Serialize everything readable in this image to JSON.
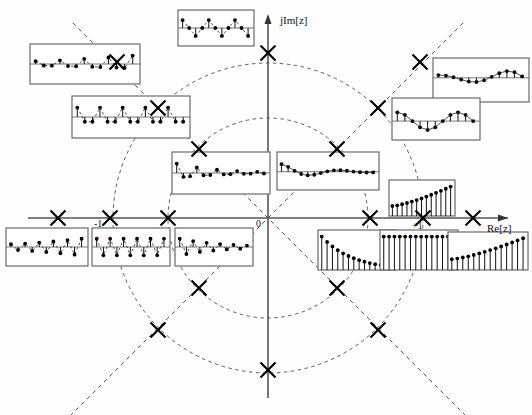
{
  "figure": {
    "domain": "z-plane",
    "axes": {
      "real_label": "Re[z]",
      "imag_label": "jIm[z]",
      "origin_label": "0",
      "tick_minus_one": "-1",
      "tick_plus_one": "+1"
    },
    "origin_px": {
      "x": 268,
      "y": 218
    },
    "circles": [
      {
        "name": "inner-dashed-circle",
        "radius_px": 100,
        "radius_value": 0.65
      },
      {
        "name": "unit-circle-dashed",
        "radius_px": 155,
        "radius_value": 1.0
      }
    ],
    "radial_lines": [
      {
        "name": "real-axis",
        "angle_deg": 0
      },
      {
        "name": "imaginary-axis",
        "angle_deg": 90
      },
      {
        "name": "diagonal-45",
        "angle_deg": 45
      },
      {
        "name": "diagonal-135",
        "angle_deg": 135
      }
    ],
    "pole_marker": "x-cross",
    "poles": [
      {
        "id": "p-re-neg-3",
        "x": 58,
        "y": 218,
        "angle_deg": 180,
        "radius_px": 210
      },
      {
        "id": "p-re-neg-2",
        "x": 110,
        "y": 218,
        "angle_deg": 180,
        "radius_px": 158
      },
      {
        "id": "p-re-neg-1",
        "x": 168,
        "y": 218,
        "angle_deg": 180,
        "radius_px": 100
      },
      {
        "id": "p-re-pos-1",
        "x": 370,
        "y": 218,
        "angle_deg": 0,
        "radius_px": 102
      },
      {
        "id": "p-re-pos-2",
        "x": 423,
        "y": 218,
        "angle_deg": 0,
        "radius_px": 155
      },
      {
        "id": "p-re-pos-3",
        "x": 473,
        "y": 218,
        "angle_deg": 0,
        "radius_px": 205
      },
      {
        "id": "p-im-pos",
        "x": 268,
        "y": 53,
        "angle_deg": 90,
        "radius_px": 165
      },
      {
        "id": "p-im-neg",
        "x": 268,
        "y": 370,
        "angle_deg": 270,
        "radius_px": 152
      },
      {
        "id": "p-ul-1",
        "x": 199,
        "y": 149,
        "angle_deg": 135,
        "radius_px": 98
      },
      {
        "id": "p-ul-2",
        "x": 158,
        "y": 108,
        "angle_deg": 135,
        "radius_px": 156
      },
      {
        "id": "p-ul-3",
        "x": 117,
        "y": 62,
        "angle_deg": 135,
        "radius_px": 215
      },
      {
        "id": "p-ur-1",
        "x": 337,
        "y": 149,
        "angle_deg": 45,
        "radius_px": 98
      },
      {
        "id": "p-ur-2",
        "x": 378,
        "y": 108,
        "angle_deg": 45,
        "radius_px": 156
      },
      {
        "id": "p-ur-3",
        "x": 420,
        "y": 62,
        "angle_deg": 45,
        "radius_px": 215
      },
      {
        "id": "p-ll-1",
        "x": 199,
        "y": 288,
        "angle_deg": 225,
        "radius_px": 98
      },
      {
        "id": "p-ll-2",
        "x": 158,
        "y": 330,
        "angle_deg": 225,
        "radius_px": 156
      },
      {
        "id": "p-lr-1",
        "x": 337,
        "y": 288,
        "angle_deg": 315,
        "radius_px": 98
      },
      {
        "id": "p-lr-2",
        "x": 378,
        "y": 330,
        "angle_deg": 315,
        "radius_px": 156
      }
    ]
  },
  "chart_data": {
    "type": "scatter",
    "xlabel": "Re[z]",
    "ylabel": "jIm[z]",
    "xlim": [
      -1.4,
      1.4
    ],
    "ylim": [
      -1.4,
      1.4
    ],
    "grid": false,
    "legend": "none",
    "series": [
      {
        "name": "poles",
        "marker": "x",
        "x": [
          -1.36,
          -1.02,
          -0.65,
          0.66,
          1.0,
          1.32,
          0.0,
          0.0,
          -0.45,
          -0.71,
          -0.98,
          0.45,
          0.71,
          0.98,
          -0.45,
          -0.71,
          0.45,
          0.71
        ],
        "y": [
          0.0,
          0.0,
          0.0,
          0.0,
          0.0,
          0.0,
          1.06,
          -0.98,
          0.45,
          0.71,
          0.98,
          0.45,
          0.71,
          0.98,
          -0.45,
          -0.71,
          -0.45,
          -0.71
        ]
      }
    ],
    "annotations": [
      "-1",
      "0",
      "+1",
      "Re[z]",
      "jIm[z]"
    ]
  },
  "inset_panels": [
    {
      "id": "inset-ul-outer",
      "data_name": "impulse-response-upper-left-outer",
      "left": 30,
      "top": 44,
      "width": 110,
      "height": 40,
      "kind": "stem-alternating-growing",
      "description": "growing alternating-sign oscillation, |z|>1, angle 135deg",
      "baseline": 0.5,
      "n": 13,
      "envelope": "growing",
      "period": 3.0,
      "amp": 0.42
    },
    {
      "id": "inset-ul-mid",
      "data_name": "impulse-response-upper-left-mid",
      "left": 72,
      "top": 96,
      "width": 118,
      "height": 42,
      "kind": "stem-alternating-constant",
      "description": "constant-amplitude oscillation on unit circle, angle 135deg",
      "baseline": 0.5,
      "n": 15,
      "envelope": "constant",
      "period": 3.0,
      "amp": 0.45
    },
    {
      "id": "inset-ul-inner",
      "data_name": "impulse-response-upper-left-inner",
      "left": 172,
      "top": 152,
      "width": 98,
      "height": 42,
      "kind": "stem-alternating-decaying",
      "description": "decaying oscillation inside unit circle, angle 135deg",
      "baseline": 0.5,
      "n": 14,
      "envelope": "decaying",
      "period": 3.0,
      "amp": 0.45
    },
    {
      "id": "inset-top",
      "data_name": "impulse-response-imaginary-axis",
      "left": 178,
      "top": 10,
      "width": 76,
      "height": 36,
      "kind": "stem-period4",
      "description": "period-4 oscillation for pole on imaginary axis",
      "baseline": 0.5,
      "n": 11,
      "envelope": "constant",
      "period": 4.0,
      "amp": 0.44
    },
    {
      "id": "inset-ur-outer",
      "data_name": "impulse-response-upper-right-outer",
      "left": 433,
      "top": 58,
      "width": 96,
      "height": 44,
      "kind": "stem-slow-growing-sine",
      "description": "slowly-oscillating growing sine, |z|>1, angle 45deg low frequency",
      "baseline": 0.45,
      "n": 12,
      "envelope": "growing",
      "period": 9.0,
      "amp": 0.36
    },
    {
      "id": "inset-ur-mid",
      "data_name": "impulse-response-upper-right-mid",
      "left": 392,
      "top": 98,
      "width": 88,
      "height": 42,
      "kind": "stem-slow-constant-sine",
      "description": "constant slow oscillation on unit circle, angle 45deg",
      "baseline": 0.55,
      "n": 11,
      "envelope": "constant",
      "period": 8.0,
      "amp": 0.42
    },
    {
      "id": "inset-ur-inner",
      "data_name": "impulse-response-upper-right-inner",
      "left": 277,
      "top": 152,
      "width": 102,
      "height": 38,
      "kind": "stem-slow-decaying-sine",
      "description": "decaying slow oscillation inside unit circle, angle 45deg",
      "baseline": 0.52,
      "n": 15,
      "envelope": "decaying",
      "period": 9.0,
      "amp": 0.4
    },
    {
      "id": "inset-real-neg-3",
      "data_name": "impulse-response-real-negative-outer",
      "left": 6,
      "top": 228,
      "width": 82,
      "height": 38,
      "kind": "stem-alternating-growing",
      "description": "alternating growing exponential, pole at z < -1",
      "baseline": 0.5,
      "n": 11,
      "envelope": "growing",
      "period": 2.0,
      "amp": 0.44
    },
    {
      "id": "inset-real-neg-2",
      "data_name": "impulse-response-real-negative-unit",
      "left": 92,
      "top": 228,
      "width": 78,
      "height": 38,
      "kind": "stem-alternating-constant",
      "description": "alternating constant amplitude, pole at z = -1",
      "baseline": 0.5,
      "n": 11,
      "envelope": "constant",
      "period": 2.0,
      "amp": 0.44
    },
    {
      "id": "inset-real-neg-1",
      "data_name": "impulse-response-real-negative-inner",
      "left": 175,
      "top": 228,
      "width": 78,
      "height": 38,
      "kind": "stem-alternating-decaying",
      "description": "alternating decaying exponential, -1 < z < 0",
      "baseline": 0.5,
      "n": 11,
      "envelope": "decaying",
      "period": 2.0,
      "amp": 0.44
    },
    {
      "id": "inset-real-pos-1",
      "data_name": "impulse-response-real-positive-inner",
      "left": 318,
      "top": 230,
      "width": 78,
      "height": 40,
      "kind": "stem-decaying",
      "description": "decaying exponential, 0 < z < 1",
      "baseline": 1.0,
      "n": 14,
      "envelope": "decaying",
      "amp": 0.88
    },
    {
      "id": "inset-real-pos-2",
      "data_name": "impulse-response-real-positive-unit",
      "left": 380,
      "top": 230,
      "width": 78,
      "height": 40,
      "kind": "stem-constant",
      "description": "constant unit step, pole at z = +1",
      "baseline": 1.0,
      "n": 14,
      "envelope": "constant",
      "amp": 0.88
    },
    {
      "id": "inset-real-pos-3",
      "data_name": "impulse-response-real-positive-outer",
      "left": 448,
      "top": 232,
      "width": 80,
      "height": 38,
      "kind": "stem-growing",
      "description": "growing exponential, z > +1",
      "baseline": 1.0,
      "n": 14,
      "envelope": "growing",
      "amp": 0.88
    },
    {
      "id": "inset-real-pos-above",
      "data_name": "impulse-response-real-positive-above-axis",
      "left": 389,
      "top": 180,
      "width": 66,
      "height": 36,
      "kind": "stem-growing",
      "description": "growing exponential above the real axis",
      "baseline": 1.0,
      "n": 13,
      "envelope": "growing",
      "amp": 0.86
    }
  ]
}
